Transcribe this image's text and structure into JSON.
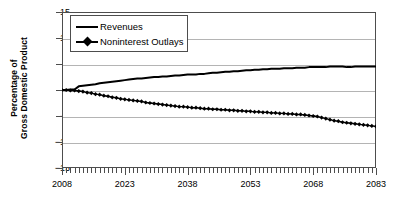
{
  "chart_data": {
    "type": "line",
    "title": "",
    "xlabel": "",
    "ylabel": "Percentage of Gross Domestic Product",
    "ylabel_lines": [
      "Percentage of",
      "Gross Domestic Product"
    ],
    "xlim": [
      2008,
      2083
    ],
    "ylim": [
      -15,
      15
    ],
    "yticks": [
      15,
      10,
      5,
      0,
      -5,
      -10,
      -15
    ],
    "ytick_labels": [
      "15",
      "10",
      "5",
      "0",
      "−5",
      "−10",
      "−15"
    ],
    "xticks": [
      2008,
      2023,
      2038,
      2053,
      2068,
      2083
    ],
    "xtick_labels": [
      "2008",
      "2023",
      "2038",
      "2053",
      "2068",
      "2083"
    ],
    "grid": true,
    "legend_position": "upper-left",
    "series": [
      {
        "name": "Revenues",
        "marker": "none",
        "color": "#000000",
        "x": [
          2008,
          2009,
          2010,
          2011,
          2012,
          2013,
          2014,
          2015,
          2016,
          2017,
          2018,
          2019,
          2020,
          2021,
          2022,
          2023,
          2024,
          2025,
          2026,
          2027,
          2028,
          2029,
          2030,
          2031,
          2032,
          2033,
          2034,
          2035,
          2036,
          2037,
          2038,
          2039,
          2040,
          2041,
          2042,
          2043,
          2044,
          2045,
          2046,
          2047,
          2048,
          2049,
          2050,
          2051,
          2052,
          2053,
          2054,
          2055,
          2056,
          2057,
          2058,
          2059,
          2060,
          2061,
          2062,
          2063,
          2064,
          2065,
          2066,
          2067,
          2068,
          2069,
          2070,
          2071,
          2072,
          2073,
          2074,
          2075,
          2076,
          2077,
          2078,
          2079,
          2080,
          2081,
          2082,
          2083
        ],
        "values": [
          0.0,
          0.0,
          0.1,
          0.1,
          0.7,
          0.8,
          0.9,
          1.0,
          1.1,
          1.3,
          1.4,
          1.5,
          1.6,
          1.7,
          1.8,
          1.9,
          2.0,
          2.1,
          2.2,
          2.2,
          2.3,
          2.4,
          2.5,
          2.5,
          2.6,
          2.6,
          2.7,
          2.8,
          2.8,
          2.9,
          3.0,
          3.0,
          3.0,
          3.1,
          3.1,
          3.2,
          3.3,
          3.3,
          3.4,
          3.5,
          3.5,
          3.6,
          3.6,
          3.7,
          3.8,
          3.8,
          3.9,
          3.9,
          4.0,
          4.0,
          4.1,
          4.1,
          4.1,
          4.2,
          4.2,
          4.2,
          4.3,
          4.3,
          4.3,
          4.4,
          4.4,
          4.4,
          4.4,
          4.4,
          4.5,
          4.5,
          4.5,
          4.5,
          4.4,
          4.4,
          4.5,
          4.5,
          4.5,
          4.5,
          4.5,
          4.5
        ]
      },
      {
        "name": "Noninterest Outlays",
        "marker": "diamond",
        "color": "#000000",
        "x": [
          2008,
          2009,
          2010,
          2011,
          2012,
          2013,
          2014,
          2015,
          2016,
          2017,
          2018,
          2019,
          2020,
          2021,
          2022,
          2023,
          2024,
          2025,
          2026,
          2027,
          2028,
          2029,
          2030,
          2031,
          2032,
          2033,
          2034,
          2035,
          2036,
          2037,
          2038,
          2039,
          2040,
          2041,
          2042,
          2043,
          2044,
          2045,
          2046,
          2047,
          2048,
          2049,
          2050,
          2051,
          2052,
          2053,
          2054,
          2055,
          2056,
          2057,
          2058,
          2059,
          2060,
          2061,
          2062,
          2063,
          2064,
          2065,
          2066,
          2067,
          2068,
          2069,
          2070,
          2071,
          2072,
          2073,
          2074,
          2075,
          2076,
          2077,
          2078,
          2079,
          2080,
          2081,
          2082,
          2083
        ],
        "values": [
          0.0,
          0.0,
          -0.1,
          -0.1,
          -0.2,
          -0.3,
          -0.5,
          -0.6,
          -0.8,
          -0.9,
          -1.1,
          -1.2,
          -1.4,
          -1.5,
          -1.7,
          -1.8,
          -1.9,
          -2.0,
          -2.1,
          -2.2,
          -2.4,
          -2.5,
          -2.6,
          -2.7,
          -2.8,
          -2.9,
          -3.0,
          -3.1,
          -3.2,
          -3.2,
          -3.3,
          -3.4,
          -3.4,
          -3.5,
          -3.6,
          -3.6,
          -3.7,
          -3.7,
          -3.8,
          -3.8,
          -3.9,
          -3.9,
          -4.0,
          -4.0,
          -4.1,
          -4.1,
          -4.2,
          -4.2,
          -4.3,
          -4.3,
          -4.4,
          -4.4,
          -4.5,
          -4.5,
          -4.6,
          -4.6,
          -4.7,
          -4.7,
          -4.8,
          -4.9,
          -5.0,
          -5.1,
          -5.3,
          -5.5,
          -5.7,
          -5.9,
          -6.0,
          -6.2,
          -6.3,
          -6.4,
          -6.5,
          -6.6,
          -6.7,
          -6.8,
          -6.9,
          -7.0
        ]
      }
    ]
  },
  "legend": {
    "items": [
      {
        "label": "Revenues"
      },
      {
        "label": "Noninterest Outlays"
      }
    ]
  }
}
